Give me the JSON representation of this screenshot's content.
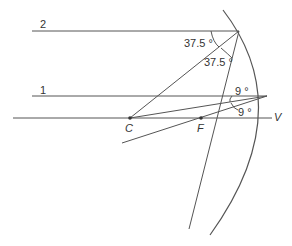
{
  "diagram": {
    "type": "spherical concave mirror ray diagram",
    "rays": [
      {
        "label": "2",
        "incident_angle": "37.5 °",
        "reflected_angle": "37.5 °"
      },
      {
        "label": "1",
        "incident_angle": "9 °",
        "reflected_angle": "9 °"
      }
    ],
    "points": {
      "center": "C",
      "focus": "F",
      "vertex": "V"
    },
    "colors": {
      "line": "#555555",
      "text": "#333333",
      "background": "#ffffff"
    }
  }
}
